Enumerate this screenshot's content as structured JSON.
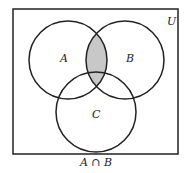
{
  "diagram": {
    "type": "venn",
    "universe_label": "U",
    "sets": [
      {
        "name": "A",
        "label": "A",
        "cx": 68,
        "cy": 60,
        "r": 39
      },
      {
        "name": "B",
        "label": "B",
        "cx": 125,
        "cy": 60,
        "r": 39
      },
      {
        "name": "C",
        "label": "C",
        "cx": 96,
        "cy": 112,
        "r": 40
      }
    ],
    "shaded_region": "A ∩ B",
    "caption": "A ∩ B",
    "colors": {
      "shade": "#c8c8c8",
      "stroke": "#222222",
      "background": "#ffffff"
    }
  }
}
